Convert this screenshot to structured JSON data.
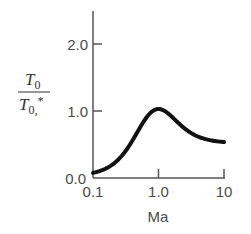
{
  "chart_data": {
    "type": "line",
    "title": "",
    "xlabel": "Ma",
    "ylabel": "T0 / T0,*",
    "ylabel_parts": {
      "num": "T",
      "num_sub": "0",
      "den": "T",
      "den_sub": "0,",
      "den_sup": "*"
    },
    "xscale": "log",
    "xlim": [
      0.1,
      10
    ],
    "ylim": [
      0.0,
      2.5
    ],
    "xticks": [
      "0.1",
      "1.0",
      "10"
    ],
    "yticks": [
      "0.0",
      "1.0",
      "2.0"
    ],
    "grid": false,
    "legend": null,
    "series": [
      {
        "name": "T0/T0*",
        "x": [
          0.1,
          0.2,
          0.3,
          0.5,
          0.7,
          1.0,
          1.5,
          2.0,
          3.0,
          5.0,
          10.0
        ],
        "y": [
          0.05,
          0.17,
          0.35,
          0.69,
          0.91,
          1.0,
          0.91,
          0.79,
          0.65,
          0.56,
          0.51
        ]
      }
    ]
  }
}
